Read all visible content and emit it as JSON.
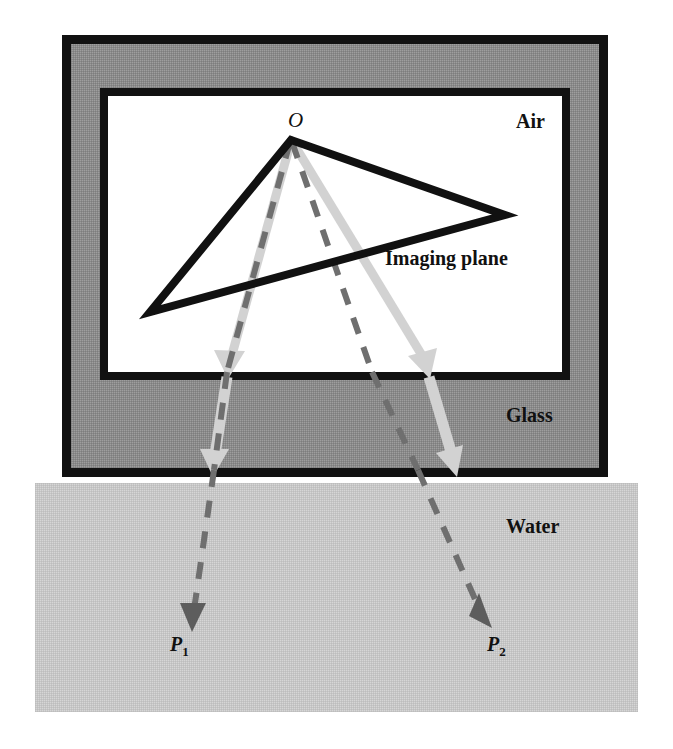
{
  "figure": {
    "labels": {
      "air": "Air",
      "glass": "Glass",
      "water": "Water",
      "imaging_plane": "Imaging plane",
      "optical_center": "O",
      "point_p1_base": "P",
      "point_p1_sub": "1",
      "point_p2_base": "P",
      "point_p2_sub": "2"
    },
    "colors": {
      "air_fill": "#ffffff",
      "glass_fill": "#8f8f8f",
      "water_fill": "#c9c9c9",
      "frame_stroke": "#111111",
      "ray_solid": "#cfcfcf",
      "ray_dashed": "#6a6a6a",
      "triangle_stroke": "#111111",
      "text": "#111111"
    },
    "geometry": {
      "outer_frame": {
        "x": 62,
        "y": 35,
        "width": 546,
        "height": 442,
        "stroke_width": 9
      },
      "inner_panel": {
        "x": 100,
        "y": 88,
        "width": 470,
        "height": 292,
        "stroke_width": 8
      },
      "water_region": {
        "x": 35,
        "y": 483,
        "width": 603,
        "height": 229
      },
      "optical_center_point": {
        "x": 291,
        "y": 140
      },
      "imaging_triangle_vertices": [
        {
          "x": 291,
          "y": 140
        },
        {
          "x": 505,
          "y": 215
        },
        {
          "x": 150,
          "y": 312
        }
      ],
      "air_glass_boundary_y": 380,
      "glass_water_boundary_y": 477,
      "ray_left": {
        "air_segment": [
          {
            "x": 291,
            "y": 140
          },
          {
            "x": 228,
            "y": 368
          }
        ],
        "glass_segment": [
          {
            "x": 228,
            "y": 368
          },
          {
            "x": 213,
            "y": 468
          }
        ],
        "water_segment": [
          {
            "x": 213,
            "y": 468
          },
          {
            "x": 193,
            "y": 628
          }
        ],
        "terminal_label": "P1"
      },
      "ray_right": {
        "air_segment": [
          {
            "x": 291,
            "y": 140
          },
          {
            "x": 428,
            "y": 368
          }
        ],
        "glass_segment": [
          {
            "x": 428,
            "y": 368
          },
          {
            "x": 455,
            "y": 468
          }
        ],
        "water_segment": [
          {
            "x": 455,
            "y": 468
          },
          {
            "x": 493,
            "y": 628
          }
        ],
        "terminal_label": "P2"
      },
      "dashed_ray_left": [
        {
          "x": 291,
          "y": 140
        },
        {
          "x": 193,
          "y": 628
        }
      ],
      "dashed_ray_right": [
        {
          "x": 291,
          "y": 140
        },
        {
          "x": 493,
          "y": 628
        }
      ]
    }
  }
}
